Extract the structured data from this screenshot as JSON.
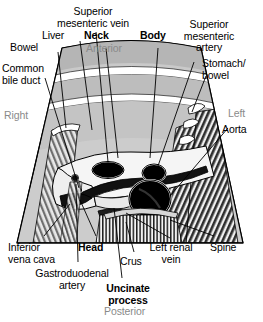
{
  "figure": {
    "orientation": {
      "anterior": "Anterior",
      "posterior": "Posterior",
      "right": "Right",
      "left": "Left"
    },
    "colors": {
      "background": "#ffffff",
      "sector_fill": "#b8b8b8",
      "sector_fill_light": "#cfcfcf",
      "pancreas_fill": "#f2f2f2",
      "vessel_fill": "#000000",
      "shadow_dark": "#3a3a3a",
      "shadow_light": "#9a9a9a",
      "orientation_text": "#8a8a8a",
      "label_text": "#000000",
      "outline": "#000000"
    }
  },
  "labels": {
    "superior_mesenteric_vein": "Superior\nmesenteric vein",
    "liver": "Liver",
    "bowel": "Bowel",
    "common_bile_duct": "Common\nbile duct",
    "neck": "Neck",
    "body": "Body",
    "superior_mesenteric_artery": "Superior\nmesenteric\nartery",
    "stomach_bowel": "Stomach/\nbowel",
    "aorta": "Aorta",
    "inferior_vena_cava": "Inferior\nvena cava",
    "gastroduodenal_artery": "Gastroduodenal\nartery",
    "head": "Head",
    "uncinate_process": "Uncinate\nprocess",
    "crus": "Crus",
    "left_renal_vein": "Left renal\nvein",
    "spine": "Spine"
  },
  "structures": [
    {
      "name": "superior-mesenteric-vein",
      "kind": "vessel",
      "emphasis": "normal"
    },
    {
      "name": "liver",
      "kind": "organ",
      "emphasis": "normal"
    },
    {
      "name": "bowel",
      "kind": "organ",
      "emphasis": "normal"
    },
    {
      "name": "common-bile-duct",
      "kind": "duct",
      "emphasis": "normal"
    },
    {
      "name": "neck",
      "kind": "pancreas-part",
      "emphasis": "bold"
    },
    {
      "name": "body",
      "kind": "pancreas-part",
      "emphasis": "bold"
    },
    {
      "name": "superior-mesenteric-artery",
      "kind": "vessel",
      "emphasis": "normal"
    },
    {
      "name": "stomach-bowel",
      "kind": "organ",
      "emphasis": "normal"
    },
    {
      "name": "aorta",
      "kind": "vessel",
      "emphasis": "normal"
    },
    {
      "name": "inferior-vena-cava",
      "kind": "vessel",
      "emphasis": "normal"
    },
    {
      "name": "gastroduodenal-artery",
      "kind": "vessel",
      "emphasis": "normal"
    },
    {
      "name": "head",
      "kind": "pancreas-part",
      "emphasis": "bold"
    },
    {
      "name": "uncinate-process",
      "kind": "pancreas-part",
      "emphasis": "bold"
    },
    {
      "name": "crus",
      "kind": "muscle",
      "emphasis": "normal"
    },
    {
      "name": "left-renal-vein",
      "kind": "vessel",
      "emphasis": "normal"
    },
    {
      "name": "spine",
      "kind": "bone",
      "emphasis": "normal"
    }
  ]
}
